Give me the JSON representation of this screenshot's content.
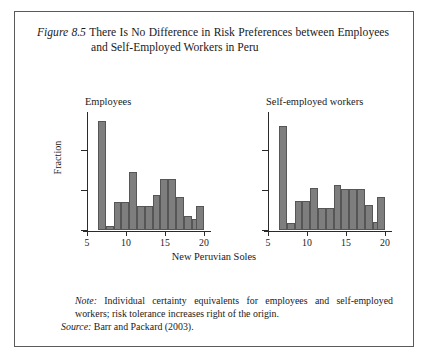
{
  "figure": {
    "number": "Figure 8.5",
    "title": "There Is No Difference in Risk Preferences between Employees and Self-Employed Workers in Peru",
    "note_lead": "Note:",
    "note_text": " Individual certainty equivalents for employees and self-employed workers; risk tolerance increases right of the origin.",
    "source_lead": "Source:",
    "source_text": " Barr and Packard (2003)."
  },
  "chart_data": {
    "type": "bar",
    "title": "There Is No Difference in Risk Preferences between Employees and Self-Employed Workers in Peru",
    "xlabel": "New Peruvian Soles",
    "ylabel": "Fraction",
    "xlim": [
      5,
      20
    ],
    "ylim": [
      0,
      0.29
    ],
    "xticks": [
      5,
      10,
      15,
      20
    ],
    "xtick_labels": [
      "5",
      "10",
      "15",
      "20"
    ],
    "yticks": [
      0,
      0.1,
      0.2
    ],
    "ytick_labels": [
      "0",
      "0.1",
      "0.2"
    ],
    "grid": false,
    "legend": false,
    "bar_color": "#7e7e7e",
    "bar_edge_color": "#565656",
    "bin_width": 1.0,
    "panels": [
      {
        "name": "employees",
        "label": "Employees",
        "show_ytick_labels": true,
        "bin_starts": [
          6.4,
          7.4,
          8.4,
          9.4,
          10.4,
          11.4,
          12.4,
          13.4,
          14.4,
          15.4,
          16.4,
          17.4,
          18.4,
          19.0
        ],
        "values": [
          0.272,
          0.011,
          0.069,
          0.069,
          0.144,
          0.06,
          0.06,
          0.088,
          0.127,
          0.127,
          0.082,
          0.036,
          0.027,
          0.06
        ]
      },
      {
        "name": "self-employed",
        "label": "Self-employed workers",
        "show_ytick_labels": false,
        "bin_starts": [
          6.4,
          7.4,
          8.4,
          9.4,
          10.4,
          11.4,
          12.4,
          13.4,
          14.4,
          15.4,
          16.4,
          17.4,
          18.4,
          19.0
        ],
        "values": [
          0.26,
          0.017,
          0.073,
          0.073,
          0.105,
          0.055,
          0.055,
          0.113,
          0.103,
          0.103,
          0.103,
          0.062,
          0.02,
          0.082
        ]
      }
    ]
  }
}
